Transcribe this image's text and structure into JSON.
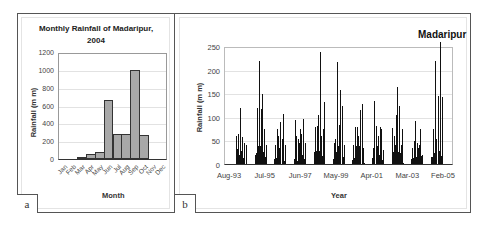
{
  "panels": {
    "a": {
      "label": "a"
    },
    "b": {
      "label": "b"
    }
  },
  "chart_data": [
    {
      "type": "bar",
      "title": "Monthly Rainfall of Madaripur, 2004",
      "title_lines": [
        "Monthly Rainfall of Madaripur,",
        "2004"
      ],
      "xlabel": "Month",
      "ylabel": "Rainfall (m m)",
      "categories": [
        "Jan",
        "Feb",
        "Mar",
        "Apr",
        "May",
        "Jun",
        "Jul",
        "Aug",
        "Sep",
        "Oct",
        "Nov",
        "Dec"
      ],
      "values": [
        0,
        0,
        10,
        55,
        80,
        670,
        285,
        285,
        1020,
        270,
        0,
        0
      ],
      "ylim": [
        0,
        1200
      ],
      "yticks": [
        0,
        200,
        400,
        600,
        800,
        1000,
        1200
      ],
      "grid": true,
      "bar_color": "#a8a8a8",
      "panel": "a"
    },
    {
      "type": "bar",
      "title": "Madaripur",
      "xlabel": "Year",
      "ylabel": "Rainfall (m m)",
      "ylim": [
        0,
        250
      ],
      "yticks": [
        0,
        50,
        100,
        150,
        200,
        250
      ],
      "xticks": [
        "Aug-93",
        "Jul-95",
        "Jun-97",
        "May-99",
        "Apr-01",
        "Mar-03",
        "Feb-05"
      ],
      "grid": true,
      "bar_color": "#111111",
      "description": "Daily rainfall series Aug-1993 to Feb-2005 with seasonal monsoon clusters",
      "seasons": [
        {
          "year": 1994,
          "peaks": [
            60,
            65,
            120,
            58,
            45,
            40
          ]
        },
        {
          "year": 1995,
          "peaks": [
            20,
            120,
            222,
            118,
            150,
            75,
            40
          ]
        },
        {
          "year": 1996,
          "peaks": [
            40,
            75,
            60,
            90,
            55,
            108,
            40
          ]
        },
        {
          "year": 1997,
          "peaks": [
            95,
            60,
            55,
            75,
            65,
            97,
            45
          ]
        },
        {
          "year": 1998,
          "peaks": [
            25,
            80,
            82,
            105,
            242,
            60,
            75,
            133
          ]
        },
        {
          "year": 1999,
          "peaks": [
            45,
            55,
            220,
            85,
            160,
            125,
            40
          ]
        },
        {
          "year": 2000,
          "peaks": [
            40,
            80,
            80,
            60,
            117,
            130,
            35
          ]
        },
        {
          "year": 2001,
          "peaks": [
            35,
            135,
            83,
            60,
            80,
            75,
            30
          ]
        },
        {
          "year": 2002,
          "peaks": [
            77,
            60,
            105,
            167,
            125,
            40,
            75
          ]
        },
        {
          "year": 2003,
          "peaks": [
            35,
            50,
            93,
            45,
            40,
            75,
            20
          ]
        },
        {
          "year": 2004,
          "peaks": [
            15,
            75,
            222,
            55,
            147,
            262,
            145
          ]
        }
      ],
      "panel": "b"
    }
  ]
}
